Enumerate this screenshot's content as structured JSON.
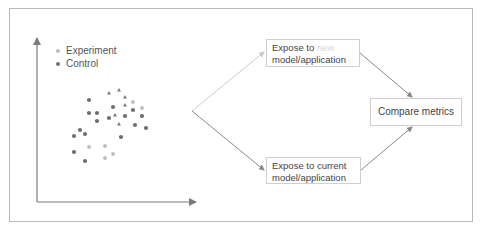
{
  "legend": {
    "items": [
      {
        "label": "Experiment",
        "color": "#bdbdbd"
      },
      {
        "label": "Control",
        "color": "#6e6e6e"
      }
    ]
  },
  "flow": {
    "top_box": {
      "line1_prefix": "Expose to ",
      "line1_highlight": "new",
      "line2": "model/application"
    },
    "bottom_box": {
      "line1": "Expose to current",
      "line2": "model/application"
    },
    "compare_box": {
      "label": "Compare metrics"
    }
  },
  "colors": {
    "control": "#6e6e6e",
    "experiment": "#bdbdbd",
    "triangle": "#7a7a7a",
    "axis": "#7a7a7a",
    "arrow_light": "#cccccc",
    "arrow_dark": "#888888",
    "border": "#b8b8b8"
  },
  "chart_data": {
    "type": "scatter",
    "title": "",
    "xlabel": "",
    "ylabel": "",
    "legend": [
      "Experiment",
      "Control"
    ],
    "legend_position": "top-left",
    "grid": false,
    "series": [
      {
        "name": "Control",
        "marker": "circle",
        "points": [
          [
            89,
            100
          ],
          [
            89,
            113
          ],
          [
            97,
            113
          ],
          [
            113,
            107
          ],
          [
            97,
            121
          ],
          [
            109,
            118
          ],
          [
            125,
            116
          ],
          [
            133,
            110
          ],
          [
            142,
            116
          ],
          [
            135,
            125
          ],
          [
            146,
            128
          ],
          [
            80,
            130
          ],
          [
            74,
            136
          ],
          [
            85,
            134
          ],
          [
            74,
            152
          ],
          [
            85,
            161
          ],
          [
            121,
            137
          ]
        ]
      },
      {
        "name": "Experiment",
        "marker": "circle",
        "points": [
          [
            89,
            147
          ],
          [
            105,
            146
          ],
          [
            113,
            154
          ],
          [
            105,
            158
          ],
          [
            133,
            102
          ],
          [
            142,
            108
          ]
        ]
      },
      {
        "name": "Unlabeled",
        "marker": "triangle",
        "points": [
          [
            109,
            93
          ],
          [
            119,
            90
          ],
          [
            125,
            97
          ],
          [
            125,
            105
          ],
          [
            115,
            115
          ],
          [
            119,
            124
          ]
        ]
      }
    ]
  }
}
